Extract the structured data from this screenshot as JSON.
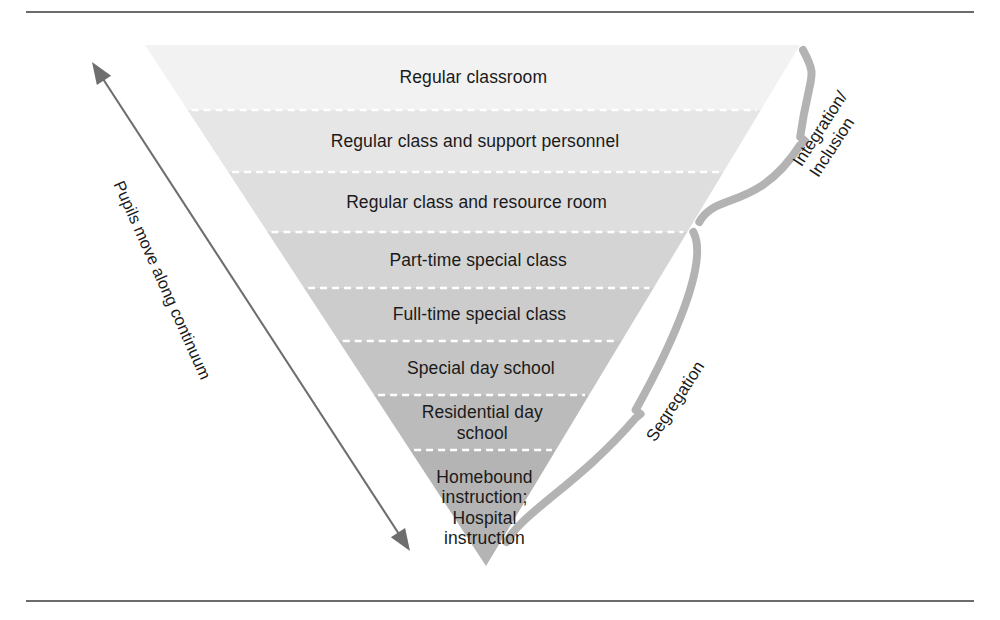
{
  "figure": {
    "background_color": "#ffffff",
    "rule_color": "#6b6b6b",
    "text_color": "#1a1a1a",
    "brace_color": "#b3b3b3",
    "arrow_color": "#6e6e6e"
  },
  "triangle": {
    "top_left_x": 145,
    "top_right_x": 800,
    "top_y": 45,
    "apex_x": 486,
    "apex_y": 566,
    "bands": [
      {
        "label": "Regular classroom",
        "fill": "#f2f2f2",
        "top": 45,
        "bottom": 110
      },
      {
        "label": "Regular class and support personnel",
        "fill": "#e6e6e6",
        "top": 110,
        "bottom": 172
      },
      {
        "label": "Regular class and resource room",
        "fill": "#dedede",
        "top": 172,
        "bottom": 232
      },
      {
        "label": "Part-time special class",
        "fill": "#d4d4d4",
        "top": 232,
        "bottom": 288
      },
      {
        "label": "Full-time special class",
        "fill": "#cccccc",
        "top": 288,
        "bottom": 341
      },
      {
        "label": "Special day school",
        "fill": "#c4c4c4",
        "top": 341,
        "bottom": 395
      },
      {
        "label": "Residential day school",
        "fill": "#bbbbbb",
        "top": 395,
        "bottom": 450
      },
      {
        "label": "Homebound\ninstruction;\nHospital\ninstruction",
        "fill": "#b4b4b4",
        "top": 450,
        "bottom": 566
      }
    ],
    "divider_color": "#ffffff"
  },
  "braces": [
    {
      "name": "integration-inclusion",
      "label": "Integration/\nInclusion",
      "top": 50,
      "bottom": 222,
      "tip_y": 141
    },
    {
      "name": "segregation",
      "label": "Segregation",
      "top": 232,
      "bottom": 542,
      "tip_y": 414
    }
  ],
  "arrow": {
    "label": "Pupils move along continuum",
    "double_headed": true,
    "start_x": 92,
    "start_y": 62,
    "end_x": 410,
    "end_y": 551
  }
}
